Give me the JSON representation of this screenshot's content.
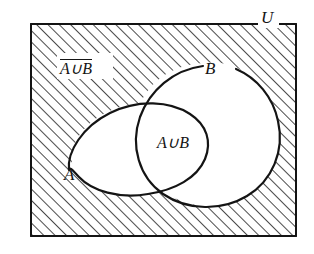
{
  "diagram": {
    "type": "venn-diagram",
    "labels": {
      "universe": "U",
      "set_a": "A",
      "set_b": "B",
      "union": "A∪B",
      "complement": "A∪B"
    },
    "regions": [
      {
        "name": "universe-rectangle",
        "fill": "hatched",
        "meaning": "universal set U"
      },
      {
        "name": "set-a-ellipse",
        "fill": "white",
        "meaning": "set A"
      },
      {
        "name": "set-b-ellipse",
        "fill": "white",
        "meaning": "set B"
      },
      {
        "name": "union-region",
        "fill": "white",
        "meaning": "A union B"
      },
      {
        "name": "complement-region",
        "fill": "hatched",
        "meaning": "complement of A union B"
      }
    ],
    "style": {
      "stroke_color": "#141414",
      "background_color": "#ffffff",
      "hatch_color": "#2b2b2b",
      "hatch_angle_degrees": 45,
      "hatch_spacing_px": 8
    }
  }
}
